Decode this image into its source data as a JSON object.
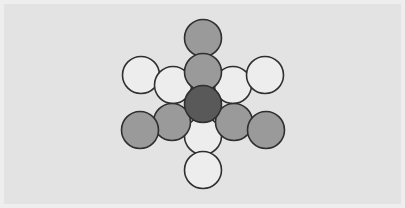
{
  "figure": {
    "background_color": "#e3e3e3",
    "border_color": "#eeeeee",
    "outline_color": "#2f2f2f",
    "width": 405,
    "height": 208
  },
  "palette": {
    "dark_gray": "#595959",
    "medium_gray": "#9a9a9a",
    "light_gray": "#b3b3b3",
    "white": "#ededed"
  },
  "chart_data": {
    "type": "scatter",
    "xlabel": "",
    "ylabel": "",
    "xlim": [
      0,
      405
    ],
    "ylim": [
      0,
      208
    ],
    "grid": false,
    "legend": "none",
    "radius": 18.5,
    "row_spacing": 32,
    "column_spacing": 37,
    "series": [
      {
        "name": "center",
        "fill": "#595959",
        "points": [
          {
            "label": "center",
            "x": 203,
            "y": 104
          }
        ]
      },
      {
        "name": "shaded",
        "fill": "#9a9a9a",
        "points": [
          {
            "label": "top-outer",
            "x": 203,
            "y": 38
          },
          {
            "label": "top-inner",
            "x": 203,
            "y": 72
          },
          {
            "label": "lower-left-inner",
            "x": 172,
            "y": 122
          },
          {
            "label": "lower-left-outer",
            "x": 140,
            "y": 130
          },
          {
            "label": "lower-right-inner",
            "x": 234,
            "y": 122
          },
          {
            "label": "lower-right-outer",
            "x": 266,
            "y": 130
          }
        ]
      },
      {
        "name": "open",
        "fill": "#ededed",
        "points": [
          {
            "label": "upper-left-outer",
            "x": 141,
            "y": 75
          },
          {
            "label": "upper-left-inner",
            "x": 173,
            "y": 85
          },
          {
            "label": "upper-right-inner",
            "x": 233,
            "y": 85
          },
          {
            "label": "upper-right-outer",
            "x": 265,
            "y": 75
          },
          {
            "label": "bottom-inner",
            "x": 203,
            "y": 136
          },
          {
            "label": "bottom-outer",
            "x": 203,
            "y": 170
          }
        ]
      }
    ]
  }
}
